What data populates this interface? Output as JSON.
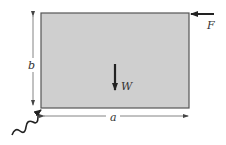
{
  "diagram": {
    "plate": {
      "fill": "#cfcfcf",
      "stroke": "#555555"
    },
    "labels": {
      "force": "F",
      "weight": "W",
      "height": "b",
      "width": "a"
    },
    "elements": [
      "rectangular plate",
      "horizontal force F at top-right corner",
      "weight W downward at center",
      "dimension b (height)",
      "dimension a (width)",
      "pin/hinge support at bottom-left corner"
    ]
  }
}
